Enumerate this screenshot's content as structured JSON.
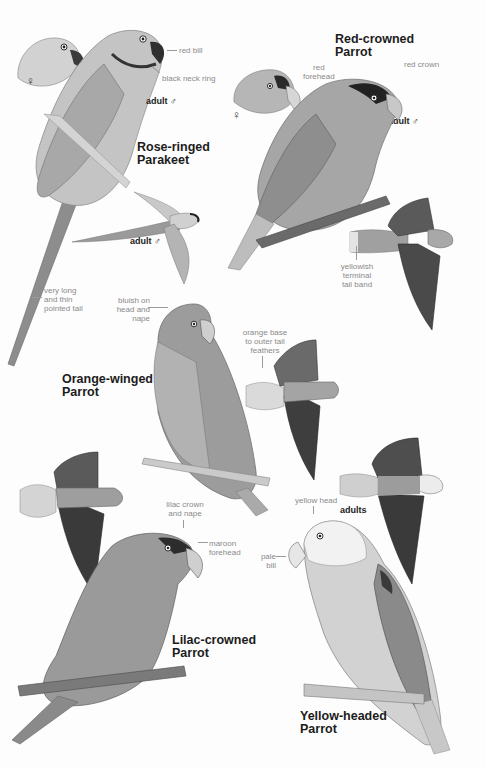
{
  "page": {
    "type": "field-guide-plate",
    "colors": {
      "background": "#fdfdfd",
      "title_text": "#1c1c1c",
      "annotation_text": "#8a8a8a",
      "ink_dark": "#2a2a2a",
      "ink_mid": "#7a7a7a",
      "ink_light": "#bdbdbd"
    }
  },
  "species": [
    {
      "id": "rose-ringed-parakeet",
      "title_line1": "Rose-ringed",
      "title_line2": "Parakeet",
      "labels": {
        "female_symbol": "♀",
        "adult_male": "adult ♂",
        "flight_adult_male": "adult ♂"
      },
      "annotations": {
        "bill": "red bill",
        "neck": "black neck ring",
        "tail_1": "very long",
        "tail_2": "and thin",
        "tail_3": "pointed tail"
      }
    },
    {
      "id": "red-crowned-parrot",
      "title_line1": "Red-crowned",
      "title_line2": "Parrot",
      "labels": {
        "female_symbol": "♀",
        "adult_male": "adult ♂"
      },
      "annotations": {
        "forehead_1": "red",
        "forehead_2": "forehead",
        "crown": "red crown",
        "tail_1": "yellowish",
        "tail_2": "terminal",
        "tail_3": "tail band"
      }
    },
    {
      "id": "orange-winged-parrot",
      "title_line1": "Orange-winged",
      "title_line2": "Parrot",
      "annotations": {
        "head_1": "bluish on",
        "head_2": "head and",
        "head_3": "nape",
        "tail_1": "orange base",
        "tail_2": "to outer tail",
        "tail_3": "feathers"
      }
    },
    {
      "id": "lilac-crowned-parrot",
      "title_line1": "Lilac-crowned",
      "title_line2": "Parrot",
      "annotations": {
        "crown_1": "lilac crown",
        "crown_2": "and nape",
        "forehead_1": "maroon",
        "forehead_2": "forehead"
      }
    },
    {
      "id": "yellow-headed-parrot",
      "title_line1": "Yellow-headed",
      "title_line2": "Parrot",
      "labels": {
        "adults": "adults"
      },
      "annotations": {
        "head": "yellow head",
        "bill_1": "pale",
        "bill_2": "bill"
      }
    }
  ]
}
